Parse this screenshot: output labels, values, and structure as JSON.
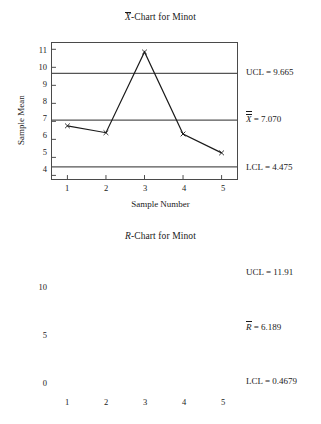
{
  "chart_data": [
    {
      "type": "line",
      "id": "xbar-chart",
      "title_prefix": "X",
      "title_suffix": "-Chart for Minot",
      "title_full": "X̄-Chart for Minot",
      "xlabel": "Sample Number",
      "ylabel": "Sample Mean",
      "categories": [
        "1",
        "2",
        "3",
        "4",
        "5"
      ],
      "x": [
        1,
        2,
        3,
        4,
        5
      ],
      "values": [
        6.75,
        6.37,
        10.85,
        6.3,
        5.25
      ],
      "ylim": [
        3.8,
        11.35
      ],
      "xlim": [
        0.6,
        5.4
      ],
      "yticks": [
        11,
        10,
        9,
        8,
        7,
        6,
        5,
        4
      ],
      "ytick_labels": [
        "11",
        "10",
        "9",
        "8",
        "7",
        "6",
        "5",
        "4"
      ],
      "grid": false,
      "legend": "none",
      "marker": "x",
      "control_lines": [
        {
          "name": "ucl",
          "value": 9.665,
          "label_prefix": "UCL",
          "label_value": "9.665",
          "label_text": "UCL = 9.665"
        },
        {
          "name": "center",
          "value": 7.07,
          "label_prefix": "X",
          "label_value": "7.070",
          "label_text": "X̿ = 7.070"
        },
        {
          "name": "lcl",
          "value": 4.475,
          "label_prefix": "LCL",
          "label_value": "4.475",
          "label_text": "LCL = 4.475"
        }
      ]
    },
    {
      "type": "line",
      "id": "r-chart",
      "title_prefix": "R",
      "title_suffix": "-Chart for Minot",
      "title_full": "R-Chart for Minot",
      "xlabel": "",
      "ylabel": "Sample Range",
      "categories": [
        "1",
        "2",
        "3",
        "4",
        "5"
      ],
      "x": [
        1,
        2,
        3,
        4,
        5
      ],
      "values": [
        5.7,
        5.0,
        8.7,
        6.7,
        6.1
      ],
      "ylim": [
        -0.65,
        12.75
      ],
      "xlim": [
        0.6,
        5.4
      ],
      "yticks": [
        10,
        5,
        0
      ],
      "ytick_labels": [
        "10",
        "5",
        "0"
      ],
      "grid": false,
      "legend": "none",
      "marker": "x",
      "control_lines": [
        {
          "name": "ucl",
          "value": 11.91,
          "label_prefix": "UCL",
          "label_value": "11.91",
          "label_text": "UCL = 11.91"
        },
        {
          "name": "center",
          "value": 6.189,
          "label_prefix": "R",
          "label_value": "6.189",
          "label_text": "R̄ = 6.189"
        },
        {
          "name": "lcl",
          "value": 0.4679,
          "label_prefix": "LCL",
          "label_value": "0.4679",
          "label_text": "LCL = 0.4679"
        }
      ]
    }
  ],
  "xbar": {
    "title_suffix": "-Chart for Minot",
    "ylabel": "Sample Mean",
    "xlabel": "Sample Number",
    "yticks": [
      "11",
      "10",
      "9",
      "8",
      "7",
      "6",
      "5",
      "4"
    ],
    "xticks": [
      "1",
      "2",
      "3",
      "4",
      "5"
    ],
    "ucl_label": "UCL = 9.665",
    "center_eq": " = 7.070",
    "center_letter": "X",
    "lcl_label": "LCL = 4.475"
  },
  "rchart": {
    "title_letter": "R",
    "title_suffix": "-Chart for Minot",
    "ylabel": "Sample Range",
    "yticks": [
      "10",
      "5",
      "0"
    ],
    "xticks": [
      "1",
      "2",
      "3",
      "4",
      "5"
    ],
    "ucl_label": "UCL = 11.91",
    "center_eq": " = 6.189",
    "center_letter": "R",
    "lcl_label": "LCL = 0.4679"
  },
  "colors": {
    "line": "#1a1a1a",
    "control_line": "#555555",
    "frame": "#4a4a4a",
    "background": "#ffffff"
  }
}
